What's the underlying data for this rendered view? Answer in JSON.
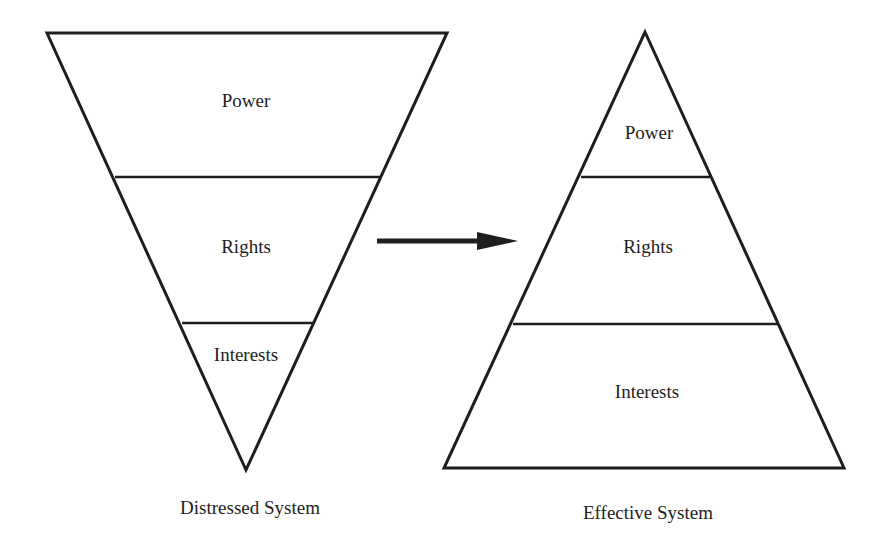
{
  "diagram": {
    "arrow": {
      "from": "distressed-system",
      "to": "effective-system",
      "direction": "right"
    },
    "distressed": {
      "caption": "Distressed System",
      "shape": "inverted-triangle",
      "layers": [
        {
          "label": "Power",
          "position": "top",
          "relative_size": "largest"
        },
        {
          "label": "Rights",
          "position": "middle",
          "relative_size": "medium"
        },
        {
          "label": "Interests",
          "position": "bottom",
          "relative_size": "smallest"
        }
      ]
    },
    "effective": {
      "caption": "Effective System",
      "shape": "upright-triangle",
      "layers": [
        {
          "label": "Power",
          "position": "top",
          "relative_size": "smallest"
        },
        {
          "label": "Rights",
          "position": "middle",
          "relative_size": "medium"
        },
        {
          "label": "Interests",
          "position": "bottom",
          "relative_size": "largest"
        }
      ]
    },
    "colors": {
      "stroke": "#1e1e1e",
      "background": "#ffffff",
      "text": "#1e1e1e"
    }
  }
}
